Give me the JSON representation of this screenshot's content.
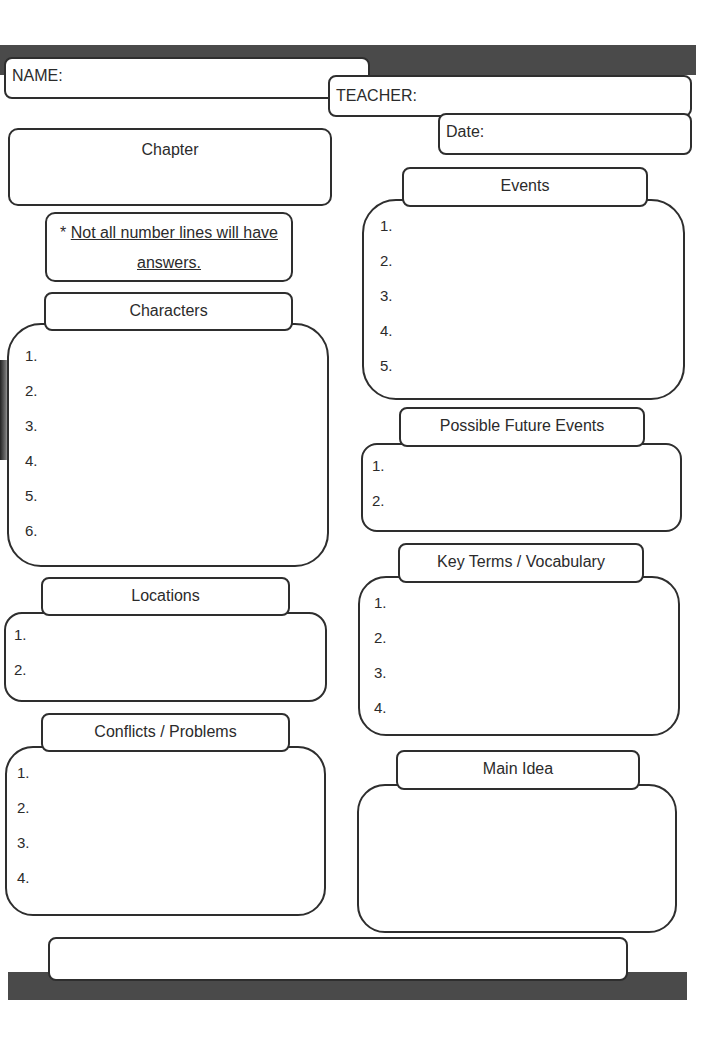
{
  "header": {
    "name_label": "NAME:",
    "teacher_label": "TEACHER:",
    "date_label": "Date:"
  },
  "chapter": {
    "label": "Chapter"
  },
  "note": {
    "prefix": "* ",
    "line1": "Not all number lines will have",
    "line2": "answers."
  },
  "sections": {
    "characters": {
      "title": "Characters",
      "items": [
        "1.",
        "2.",
        "3.",
        "4.",
        "5.",
        "6."
      ]
    },
    "locations": {
      "title": "Locations",
      "items": [
        "1.",
        "2."
      ]
    },
    "conflicts": {
      "title": "Conflicts / Problems",
      "items": [
        "1.",
        "2.",
        "3.",
        "4."
      ]
    },
    "events": {
      "title": "Events",
      "items": [
        "1.",
        "2.",
        "3.",
        "4.",
        "5."
      ]
    },
    "future_events": {
      "title": "Possible Future Events",
      "items": [
        "1.",
        "2."
      ]
    },
    "vocabulary": {
      "title": "Key Terms / Vocabulary",
      "items": [
        "1.",
        "2.",
        "3.",
        "4."
      ]
    },
    "main_idea": {
      "title": "Main Idea"
    }
  },
  "colors": {
    "bar": "#4a4a4a",
    "border": "#2e2e2e",
    "text": "#2b2b2b"
  }
}
